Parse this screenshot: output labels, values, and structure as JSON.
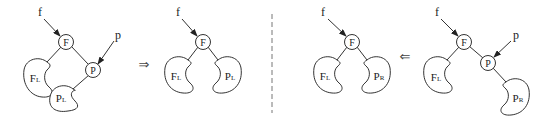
{
  "diagram": {
    "title": "",
    "panels": [
      {
        "id": "before-left",
        "pointers": [
          {
            "label": "f",
            "target": "F"
          },
          {
            "label": "p",
            "target": "P"
          }
        ],
        "nodes": [
          "F",
          "P"
        ],
        "subtrees": [
          {
            "main": "F",
            "sub": "L"
          },
          {
            "main": "P",
            "sub": "L"
          }
        ]
      },
      {
        "id": "after-left",
        "pointers": [
          {
            "label": "f",
            "target": "F"
          }
        ],
        "nodes": [
          "F"
        ],
        "subtrees": [
          {
            "main": "F",
            "sub": "L"
          },
          {
            "main": "P",
            "sub": "L"
          }
        ]
      },
      {
        "id": "after-right",
        "pointers": [
          {
            "label": "f",
            "target": "F"
          }
        ],
        "nodes": [
          "F"
        ],
        "subtrees": [
          {
            "main": "F",
            "sub": "L"
          },
          {
            "main": "P",
            "sub": "R"
          }
        ]
      },
      {
        "id": "before-right",
        "pointers": [
          {
            "label": "f",
            "target": "F"
          },
          {
            "label": "p",
            "target": "P"
          }
        ],
        "nodes": [
          "F",
          "P"
        ],
        "subtrees": [
          {
            "main": "F",
            "sub": "L"
          },
          {
            "main": "P",
            "sub": "R"
          }
        ]
      }
    ],
    "transitions": {
      "left": "⇒",
      "right": "⇐"
    }
  }
}
